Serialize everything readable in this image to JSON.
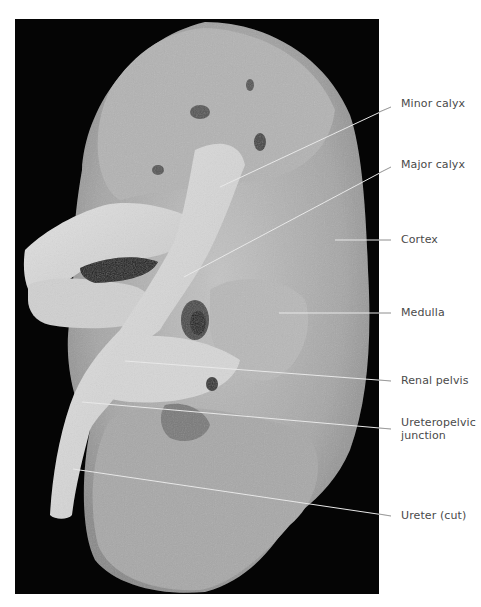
{
  "figure": {
    "background_color": "#050505",
    "tissue_color": "#a9a9a9",
    "leader_line_color": "#e8e8e8",
    "label_color": "#4a4a4a"
  },
  "labels": [
    {
      "id": "minor-calyx",
      "text": "Minor calyx",
      "line": [
        220,
        187,
        391,
        107
      ],
      "text_y": 97
    },
    {
      "id": "major-calyx",
      "text": "Major calyx",
      "line": [
        184,
        277,
        391,
        167
      ],
      "text_y": 158
    },
    {
      "id": "cortex",
      "text": "Cortex",
      "line": [
        335,
        240,
        391,
        240
      ],
      "text_y": 233
    },
    {
      "id": "medulla",
      "text": "Medulla",
      "line": [
        279,
        313,
        391,
        313
      ],
      "text_y": 306
    },
    {
      "id": "renal-pelvis",
      "text": "Renal pelvis",
      "line": [
        125,
        361,
        391,
        381
      ],
      "text_y": 374
    },
    {
      "id": "ureteropelvic-junction",
      "text_line1": "Ureteropelvic",
      "text_line2": "junction",
      "line": [
        82,
        402,
        391,
        429
      ],
      "text_y": 416
    },
    {
      "id": "ureter-cut",
      "text": "Ureter (cut)",
      "line": [
        73,
        469,
        391,
        516
      ],
      "text_y": 509
    }
  ]
}
